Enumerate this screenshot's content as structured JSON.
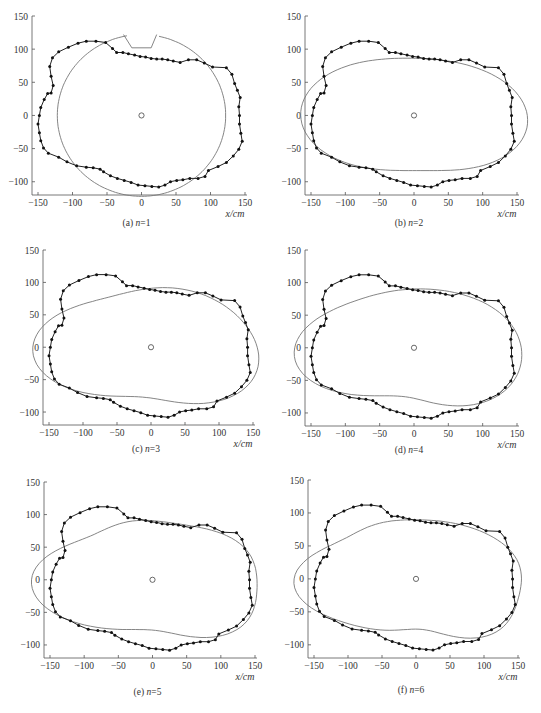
{
  "figure": {
    "panels": 6
  },
  "chart_data": [
    {
      "id": "a",
      "type": "line",
      "caption_prefix": "(a)",
      "caption_var": "n",
      "caption_eq": "=1",
      "n": 1,
      "xlabel": "x/cm",
      "ylabel": "",
      "xlim": [
        -150,
        150
      ],
      "ylim": [
        -120,
        150
      ],
      "xticks": [
        -150,
        -100,
        -50,
        0,
        50,
        100,
        150
      ],
      "yticks": [
        -100,
        -50,
        0,
        50,
        100,
        150
      ],
      "center": [
        0,
        0
      ]
    },
    {
      "id": "b",
      "type": "line",
      "caption_prefix": "(b)",
      "caption_var": "n",
      "caption_eq": "=2",
      "n": 2,
      "xlabel": "x/cm",
      "ylabel": "",
      "xlim": [
        -150,
        150
      ],
      "ylim": [
        -120,
        150
      ],
      "xticks": [
        -150,
        -100,
        -50,
        0,
        50,
        100,
        150
      ],
      "yticks": [
        -100,
        -50,
        0,
        50,
        100,
        150
      ],
      "center": [
        0,
        0
      ]
    },
    {
      "id": "c",
      "type": "line",
      "caption_prefix": "(c)",
      "caption_var": "n",
      "caption_eq": "=3",
      "n": 3,
      "xlabel": "x/cm",
      "ylabel": "",
      "xlim": [
        -150,
        150
      ],
      "ylim": [
        -120,
        150
      ],
      "xticks": [
        -150,
        -100,
        -50,
        0,
        50,
        100,
        150
      ],
      "yticks": [
        -100,
        -50,
        0,
        50,
        100,
        150
      ],
      "center": [
        0,
        0
      ]
    },
    {
      "id": "d",
      "type": "line",
      "caption_prefix": "(d)",
      "caption_var": "n",
      "caption_eq": "=4",
      "n": 4,
      "xlabel": "x/cm",
      "ylabel": "",
      "xlim": [
        -150,
        150
      ],
      "ylim": [
        -120,
        150
      ],
      "xticks": [
        -150,
        -100,
        -50,
        0,
        50,
        100,
        150
      ],
      "yticks": [
        -100,
        -50,
        0,
        50,
        100,
        150
      ],
      "center": [
        0,
        0
      ]
    },
    {
      "id": "e",
      "type": "line",
      "caption_prefix": "(e)",
      "caption_var": "n",
      "caption_eq": "=5",
      "n": 5,
      "xlabel": "x/cm",
      "ylabel": "",
      "xlim": [
        -150,
        150
      ],
      "ylim": [
        -120,
        150
      ],
      "xticks": [
        -150,
        -100,
        -50,
        0,
        50,
        100,
        150
      ],
      "yticks": [
        -100,
        -50,
        0,
        50,
        100,
        150
      ],
      "center": [
        0,
        0
      ]
    },
    {
      "id": "f",
      "type": "line",
      "caption_prefix": "(f)",
      "caption_var": "n",
      "caption_eq": "=6",
      "n": 6,
      "xlabel": "x/cm",
      "ylabel": "",
      "xlim": [
        -150,
        150
      ],
      "ylim": [
        -120,
        150
      ],
      "xticks": [
        -150,
        -100,
        -50,
        0,
        50,
        100,
        150
      ],
      "yticks": [
        -100,
        -50,
        0,
        50,
        100,
        150
      ],
      "center": [
        0,
        0
      ]
    }
  ],
  "measured_contour": {
    "name": "measured",
    "points": [
      [
        -148,
        0
      ],
      [
        -146,
        12
      ],
      [
        -141,
        24
      ],
      [
        -136,
        33
      ],
      [
        -131,
        34
      ],
      [
        -128,
        45
      ],
      [
        -131,
        59
      ],
      [
        -133,
        74
      ],
      [
        -129,
        87
      ],
      [
        -120,
        96
      ],
      [
        -106,
        103
      ],
      [
        -92,
        109
      ],
      [
        -80,
        112
      ],
      [
        -66,
        112
      ],
      [
        -52,
        110
      ],
      [
        -42,
        101
      ],
      [
        -36,
        95
      ],
      [
        -27,
        95
      ],
      [
        -19,
        93
      ],
      [
        -10,
        91
      ],
      [
        -2,
        89
      ],
      [
        6,
        88
      ],
      [
        14,
        86
      ],
      [
        22,
        85
      ],
      [
        30,
        85
      ],
      [
        38,
        84
      ],
      [
        46,
        82
      ],
      [
        56,
        80
      ],
      [
        68,
        84
      ],
      [
        80,
        84
      ],
      [
        91,
        79
      ],
      [
        103,
        73
      ],
      [
        123,
        72
      ],
      [
        131,
        62
      ],
      [
        135,
        48
      ],
      [
        139,
        38
      ],
      [
        143,
        27
      ],
      [
        141,
        13
      ],
      [
        142,
        0
      ],
      [
        142,
        -13
      ],
      [
        144,
        -27
      ],
      [
        146,
        -39
      ],
      [
        141,
        -51
      ],
      [
        133,
        -61
      ],
      [
        123,
        -71
      ],
      [
        111,
        -77
      ],
      [
        97,
        -83
      ],
      [
        92,
        -92
      ],
      [
        82,
        -95
      ],
      [
        70,
        -95
      ],
      [
        60,
        -97
      ],
      [
        51,
        -98
      ],
      [
        42,
        -100
      ],
      [
        34,
        -105
      ],
      [
        25,
        -108
      ],
      [
        15,
        -107
      ],
      [
        5,
        -106
      ],
      [
        -5,
        -105
      ],
      [
        -15,
        -101
      ],
      [
        -25,
        -98
      ],
      [
        -35,
        -95
      ],
      [
        -45,
        -91
      ],
      [
        -55,
        -85
      ],
      [
        -60,
        -81
      ],
      [
        -70,
        -79
      ],
      [
        -80,
        -78
      ],
      [
        -94,
        -76
      ],
      [
        -108,
        -70
      ],
      [
        -120,
        -63
      ],
      [
        -135,
        -57
      ],
      [
        -142,
        -49
      ],
      [
        -146,
        -38
      ],
      [
        -148,
        -26
      ],
      [
        -150,
        -13
      ]
    ]
  },
  "fitted_curves": {
    "a": {
      "shape": "circle",
      "cx": 0,
      "cy": 0,
      "r": 122,
      "notch": [
        [
          -26,
          122
        ],
        [
          -14,
          102
        ],
        [
          14,
          102
        ],
        [
          22,
          122
        ]
      ],
      "gap_right": true
    },
    "b": {
      "a0": 128,
      "terms": [
        [
          0,
          0
        ],
        [
          22,
          0
        ],
        [
          0,
          -2
        ],
        [
          0,
          0
        ],
        [
          0,
          0
        ],
        [
          0,
          0
        ]
      ],
      "cy_offset": 0
    },
    "c": {
      "a0": 128,
      "terms": [
        [
          0,
          0
        ],
        [
          22,
          0
        ],
        [
          -8,
          -6
        ],
        [
          0,
          0
        ],
        [
          0,
          0
        ],
        [
          0,
          0
        ]
      ]
    },
    "d": {
      "a0": 128,
      "terms": [
        [
          0,
          0
        ],
        [
          22,
          0
        ],
        [
          -8,
          -6
        ],
        [
          0,
          3
        ],
        [
          0,
          0
        ],
        [
          0,
          0
        ]
      ]
    },
    "e": {
      "a0": 128,
      "terms": [
        [
          0,
          0
        ],
        [
          22,
          0
        ],
        [
          -8,
          -6
        ],
        [
          0,
          3
        ],
        [
          -3,
          2
        ],
        [
          0,
          0
        ]
      ]
    },
    "f": {
      "a0": 128,
      "terms": [
        [
          0,
          0
        ],
        [
          22,
          0
        ],
        [
          -8,
          -6
        ],
        [
          0,
          3
        ],
        [
          -3,
          2
        ],
        [
          2,
          1
        ]
      ]
    }
  }
}
